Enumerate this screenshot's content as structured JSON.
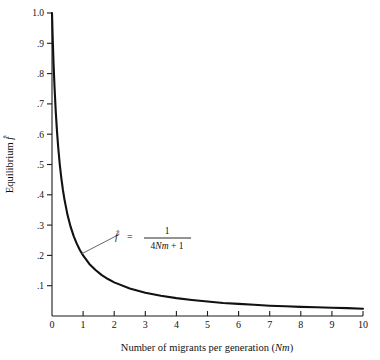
{
  "figure": {
    "background_color": "#ffffff",
    "curve_color": "#111111",
    "axis_color": "#1a1a1a",
    "leader_color": "#555555"
  },
  "chart_data": {
    "type": "line",
    "title": "",
    "xlabel": "Number of migrants per generation (Nm)",
    "xlabel_plain": "Number of migrants per generation",
    "xlabel_symbol": "Nm",
    "ylabel": "Equilibrium f̂",
    "ylabel_plain": "Equilibrium",
    "ylabel_symbol": "f̂",
    "xlim": [
      0,
      10
    ],
    "ylim": [
      0,
      1.0
    ],
    "grid": false,
    "legend": "none",
    "xticks": [
      0,
      1,
      2,
      3,
      4,
      5,
      6,
      7,
      8,
      9,
      10
    ],
    "xtick_labels": [
      "0",
      "1",
      "2",
      "3",
      "4",
      "5",
      "6",
      "7",
      "8",
      "9",
      "10"
    ],
    "yticks": [
      0.1,
      0.2,
      0.3,
      0.4,
      0.5,
      0.6,
      0.7,
      0.8,
      0.9,
      1.0
    ],
    "ytick_labels": [
      ".1",
      ".2",
      ".3",
      ".4",
      ".5",
      ".6",
      ".7",
      ".8",
      ".9",
      "1.0"
    ],
    "equation": "f̂ = 1 / (4Nm + 1)",
    "equation_lhs": "f̂",
    "equation_equals": "=",
    "equation_numerator": "1",
    "equation_denominator_prefix": "4",
    "equation_denominator_symbol": "Nm",
    "equation_denominator_suffix": " + 1",
    "series": [
      {
        "name": "f̂ = 1/(4Nm + 1)",
        "x": [
          0.0,
          0.02,
          0.05,
          0.08,
          0.12,
          0.16,
          0.2,
          0.25,
          0.3,
          0.35,
          0.4,
          0.5,
          0.6,
          0.7,
          0.8,
          0.9,
          1.0,
          1.2,
          1.4,
          1.6,
          1.8,
          2.0,
          2.5,
          3.0,
          3.5,
          4.0,
          4.5,
          5.0,
          5.5,
          6.0,
          6.5,
          7.0,
          7.5,
          8.0,
          8.5,
          9.0,
          9.5,
          10.0
        ],
        "y": [
          1.0,
          0.926,
          0.833,
          0.758,
          0.676,
          0.61,
          0.556,
          0.5,
          0.455,
          0.417,
          0.385,
          0.333,
          0.294,
          0.263,
          0.238,
          0.217,
          0.2,
          0.172,
          0.152,
          0.135,
          0.122,
          0.111,
          0.091,
          0.077,
          0.067,
          0.059,
          0.053,
          0.048,
          0.043,
          0.04,
          0.037,
          0.034,
          0.032,
          0.03,
          0.029,
          0.027,
          0.026,
          0.024
        ]
      }
    ],
    "annotation": {
      "leader_from": [
        0.95,
        0.205
      ],
      "leader_to": [
        2.17,
        0.27
      ]
    }
  }
}
